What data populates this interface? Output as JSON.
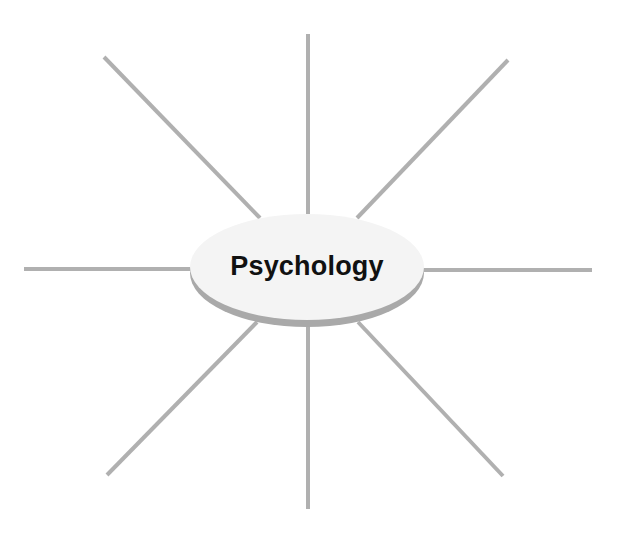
{
  "diagram": {
    "type": "spider-map",
    "center": {
      "label": "Psychology",
      "fill_color": "#f4f4f4",
      "rim_color": "#a9a9a9",
      "text_color": "#111111"
    },
    "spoke_color": "#b0b0b0",
    "spokes": [
      {
        "name": "spoke-top",
        "x1": 308,
        "y1": 34,
        "x2": 308,
        "y2": 214
      },
      {
        "name": "spoke-top-right",
        "x1": 508,
        "y1": 60,
        "x2": 357,
        "y2": 218
      },
      {
        "name": "spoke-right",
        "x1": 423,
        "y1": 270,
        "x2": 592,
        "y2": 270
      },
      {
        "name": "spoke-bottom-right",
        "x1": 358,
        "y1": 322,
        "x2": 503,
        "y2": 476
      },
      {
        "name": "spoke-bottom",
        "x1": 308,
        "y1": 326,
        "x2": 308,
        "y2": 509
      },
      {
        "name": "spoke-bottom-left",
        "x1": 257,
        "y1": 322,
        "x2": 107,
        "y2": 475
      },
      {
        "name": "spoke-left",
        "x1": 24,
        "y1": 269,
        "x2": 191,
        "y2": 269
      },
      {
        "name": "spoke-top-left",
        "x1": 104,
        "y1": 57,
        "x2": 260,
        "y2": 218
      }
    ]
  }
}
